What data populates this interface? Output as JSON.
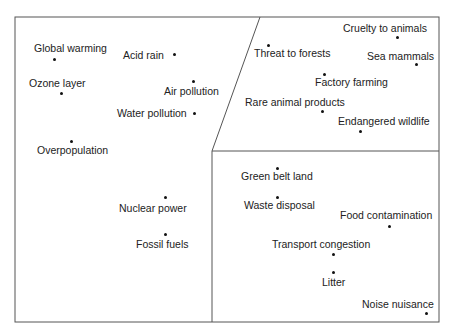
{
  "diagram": {
    "type": "concept-map",
    "frame": {
      "left": 15,
      "top": 17,
      "right": 439,
      "bottom": 322
    },
    "dividers": {
      "diagonal": {
        "x1": 212,
        "y1": 151,
        "x2": 260,
        "y2": 17
      },
      "vertical": {
        "x1": 212,
        "y1": 151,
        "x2": 212,
        "y2": 322
      },
      "horizontal": {
        "x1": 212,
        "y1": 151,
        "x2": 439,
        "y2": 151
      }
    },
    "regions": [
      {
        "name": "global-environment",
        "items": [
          {
            "label": "Global warming",
            "lx": 34,
            "ly": 42,
            "dx": 54,
            "dy": 59
          },
          {
            "label": "Acid rain",
            "lx": 123,
            "ly": 49,
            "dx": 174,
            "dy": 54
          },
          {
            "label": "Ozone layer",
            "lx": 29,
            "ly": 77,
            "dx": 61,
            "dy": 93
          },
          {
            "label": "Air pollution",
            "lx": 164,
            "ly": 85,
            "dx": 193,
            "dy": 81
          },
          {
            "label": "Water pollution",
            "lx": 117,
            "ly": 107,
            "dx": 194,
            "dy": 113
          },
          {
            "label": "Overpopulation",
            "lx": 37,
            "ly": 144,
            "dx": 71,
            "dy": 141
          },
          {
            "label": "Nuclear power",
            "lx": 119,
            "ly": 202,
            "dx": 165,
            "dy": 197
          },
          {
            "label": "Fossil fuels",
            "lx": 136,
            "ly": 238,
            "dx": 165,
            "dy": 234
          }
        ]
      },
      {
        "name": "animals-wildlife",
        "items": [
          {
            "label": "Cruelty to animals",
            "lx": 343,
            "ly": 22,
            "dx": 397,
            "dy": 37
          },
          {
            "label": "Threat to forests",
            "lx": 254,
            "ly": 47,
            "dx": 268,
            "dy": 45
          },
          {
            "label": "Sea mammals",
            "lx": 367,
            "ly": 50,
            "dx": 416,
            "dy": 64
          },
          {
            "label": "Factory farming",
            "lx": 315,
            "ly": 76,
            "dx": 324,
            "dy": 74
          },
          {
            "label": "Rare animal products",
            "lx": 245,
            "ly": 96,
            "dx": 322,
            "dy": 111
          },
          {
            "label": "Endangered wildlife",
            "lx": 338,
            "ly": 115,
            "dx": 360,
            "dy": 131
          }
        ]
      },
      {
        "name": "local-environment",
        "items": [
          {
            "label": "Green belt land",
            "lx": 241,
            "ly": 170,
            "dx": 277,
            "dy": 168
          },
          {
            "label": "Waste disposal",
            "lx": 244,
            "ly": 199,
            "dx": 277,
            "dy": 197
          },
          {
            "label": "Food contamination",
            "lx": 340,
            "ly": 209,
            "dx": 389,
            "dy": 226
          },
          {
            "label": "Transport congestion",
            "lx": 272,
            "ly": 238,
            "dx": 333,
            "dy": 254
          },
          {
            "label": "Litter",
            "lx": 322,
            "ly": 276,
            "dx": 333,
            "dy": 272
          },
          {
            "label": "Noise nuisance",
            "lx": 362,
            "ly": 298,
            "dx": 426,
            "dy": 313
          }
        ]
      }
    ]
  }
}
